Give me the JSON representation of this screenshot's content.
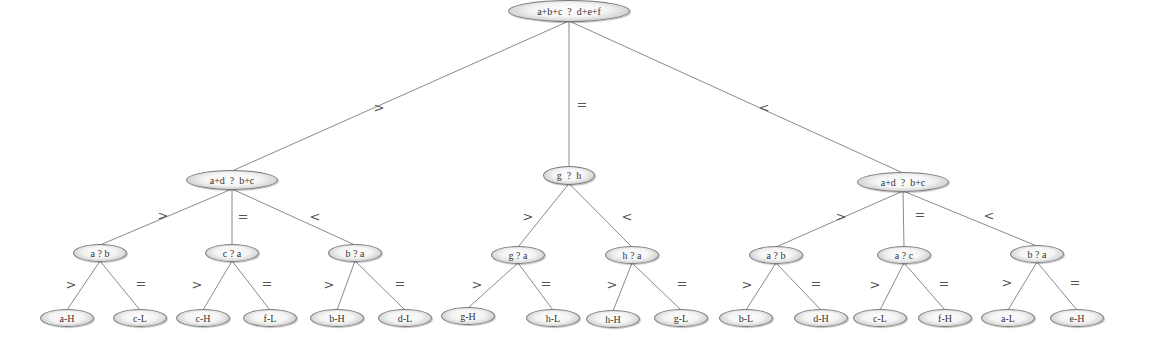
{
  "diagram": {
    "type": "decision-tree",
    "nodes": {
      "root": {
        "text": "a+b+c  ?  d+e+f",
        "x": 569,
        "y": 11,
        "w": 122,
        "h": 22
      },
      "L": {
        "text": "a+d  ?  b+c",
        "x": 232,
        "y": 180,
        "w": 92,
        "h": 20
      },
      "M": {
        "text": "g  ?  h",
        "x": 569,
        "y": 175,
        "w": 52,
        "h": 19
      },
      "R": {
        "text": "a+d  ?  b+c",
        "x": 903,
        "y": 182,
        "w": 92,
        "h": 20
      },
      "L1": {
        "text": "a ? b",
        "x": 100,
        "y": 253,
        "w": 54,
        "h": 18
      },
      "L2": {
        "text": "c ? a",
        "x": 232,
        "y": 253,
        "w": 54,
        "h": 18
      },
      "L3": {
        "text": "b ? a",
        "x": 355,
        "y": 253,
        "w": 54,
        "h": 18
      },
      "M1": {
        "text": "g ? a",
        "x": 518,
        "y": 255,
        "w": 54,
        "h": 18
      },
      "M2": {
        "text": "h ? a",
        "x": 632,
        "y": 255,
        "w": 54,
        "h": 18
      },
      "R1": {
        "text": "a ? b",
        "x": 776,
        "y": 255,
        "w": 54,
        "h": 18
      },
      "R2": {
        "text": "a ? c",
        "x": 904,
        "y": 255,
        "w": 54,
        "h": 18
      },
      "R3": {
        "text": "b ? a",
        "x": 1037,
        "y": 254,
        "w": 54,
        "h": 18
      },
      "l1": {
        "text": "a-H",
        "x": 67,
        "y": 318,
        "w": 54,
        "h": 18
      },
      "l2": {
        "text": "c-L",
        "x": 140,
        "y": 318,
        "w": 54,
        "h": 18
      },
      "l3": {
        "text": "c-H",
        "x": 203,
        "y": 318,
        "w": 54,
        "h": 18
      },
      "l4": {
        "text": "f-L",
        "x": 270,
        "y": 318,
        "w": 54,
        "h": 18
      },
      "l5": {
        "text": "b-H",
        "x": 337,
        "y": 318,
        "w": 54,
        "h": 18
      },
      "l6": {
        "text": "d-L",
        "x": 405,
        "y": 318,
        "w": 54,
        "h": 18
      },
      "l7": {
        "text": "g-H",
        "x": 468,
        "y": 316,
        "w": 54,
        "h": 18
      },
      "l8": {
        "text": "h-L",
        "x": 553,
        "y": 318,
        "w": 54,
        "h": 18
      },
      "l9": {
        "text": "h-H",
        "x": 613,
        "y": 319,
        "w": 54,
        "h": 18
      },
      "l10": {
        "text": "g-L",
        "x": 681,
        "y": 318,
        "w": 54,
        "h": 18
      },
      "l11": {
        "text": "b-L",
        "x": 746,
        "y": 318,
        "w": 54,
        "h": 18
      },
      "l12": {
        "text": "d-H",
        "x": 821,
        "y": 318,
        "w": 54,
        "h": 18
      },
      "l13": {
        "text": "c-L",
        "x": 880,
        "y": 318,
        "w": 54,
        "h": 18
      },
      "l14": {
        "text": "f-H",
        "x": 945,
        "y": 318,
        "w": 54,
        "h": 18
      },
      "l15": {
        "text": "a-L",
        "x": 1008,
        "y": 318,
        "w": 54,
        "h": 18
      },
      "l16": {
        "text": "e-H",
        "x": 1077,
        "y": 318,
        "w": 54,
        "h": 18
      }
    },
    "edges": [
      {
        "from": "root",
        "to": "L",
        "label": ">",
        "lx": 379,
        "ly": 107
      },
      {
        "from": "root",
        "to": "M",
        "label": "=",
        "lx": 582,
        "ly": 104
      },
      {
        "from": "root",
        "to": "R",
        "label": "<",
        "lx": 764,
        "ly": 107
      },
      {
        "from": "L",
        "to": "L1",
        "label": ">",
        "lx": 163,
        "ly": 215
      },
      {
        "from": "L",
        "to": "L2",
        "label": "=",
        "lx": 243,
        "ly": 216
      },
      {
        "from": "L",
        "to": "L3",
        "label": "<",
        "lx": 315,
        "ly": 216
      },
      {
        "from": "M",
        "to": "M1",
        "label": ">",
        "lx": 528,
        "ly": 216
      },
      {
        "from": "M",
        "to": "M2",
        "label": "<",
        "lx": 627,
        "ly": 216
      },
      {
        "from": "R",
        "to": "R1",
        "label": ">",
        "lx": 841,
        "ly": 216
      },
      {
        "from": "R",
        "to": "R2",
        "label": "=",
        "lx": 920,
        "ly": 214
      },
      {
        "from": "R",
        "to": "R3",
        "label": "<",
        "lx": 989,
        "ly": 215
      },
      {
        "from": "L1",
        "to": "l1",
        "label": ">",
        "lx": 71,
        "ly": 284
      },
      {
        "from": "L1",
        "to": "l2",
        "label": "=",
        "lx": 141,
        "ly": 283
      },
      {
        "from": "L2",
        "to": "l3",
        "label": ">",
        "lx": 197,
        "ly": 284
      },
      {
        "from": "L2",
        "to": "l4",
        "label": "=",
        "lx": 267,
        "ly": 283
      },
      {
        "from": "L3",
        "to": "l5",
        "label": ">",
        "lx": 329,
        "ly": 284
      },
      {
        "from": "L3",
        "to": "l6",
        "label": "=",
        "lx": 400,
        "ly": 283
      },
      {
        "from": "M1",
        "to": "l7",
        "label": ">",
        "lx": 477,
        "ly": 284
      },
      {
        "from": "M1",
        "to": "l8",
        "label": "=",
        "lx": 546,
        "ly": 283
      },
      {
        "from": "M2",
        "to": "l9",
        "label": ">",
        "lx": 612,
        "ly": 284
      },
      {
        "from": "M2",
        "to": "l10",
        "label": "=",
        "lx": 682,
        "ly": 283
      },
      {
        "from": "R1",
        "to": "l11",
        "label": ">",
        "lx": 747,
        "ly": 284
      },
      {
        "from": "R1",
        "to": "l12",
        "label": "=",
        "lx": 816,
        "ly": 283
      },
      {
        "from": "R2",
        "to": "l13",
        "label": ">",
        "lx": 875,
        "ly": 284
      },
      {
        "from": "R2",
        "to": "l14",
        "label": "=",
        "lx": 944,
        "ly": 283
      },
      {
        "from": "R3",
        "to": "l15",
        "label": ">",
        "lx": 1007,
        "ly": 282
      },
      {
        "from": "R3",
        "to": "l16",
        "label": "=",
        "lx": 1075,
        "ly": 282
      }
    ]
  }
}
